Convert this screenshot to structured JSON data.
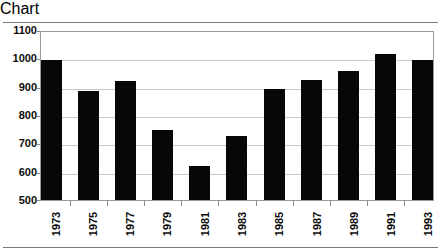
{
  "chart_data": {
    "type": "bar",
    "title": "",
    "subtitle": "",
    "xlabel": "",
    "ylabel": "",
    "categories": [
      "1973",
      "1975",
      "1977",
      "1979",
      "1981",
      "1983",
      "1985",
      "1987",
      "1989",
      "1991",
      "1993"
    ],
    "values": [
      1000,
      890,
      925,
      750,
      620,
      730,
      895,
      930,
      960,
      1020,
      1000
    ],
    "series": [
      {
        "name": "",
        "values": [
          1000,
          890,
          925,
          750,
          620,
          730,
          895,
          930,
          960,
          1020,
          1000
        ]
      }
    ],
    "ylim": [
      500,
      1100
    ],
    "ytick_labels": [
      "1100",
      "1000",
      "900",
      "800",
      "700",
      "600",
      "500"
    ],
    "ytick_values": [
      1100,
      1000,
      900,
      800,
      700,
      600,
      500
    ],
    "grid": "horizontal",
    "legend": "none",
    "bar_color": "#070707",
    "gridline_color": "#c9c9c9",
    "frame_color": "#9a9a9a",
    "background_color": "#ffffff",
    "xlabel_rotation": 90,
    "annotations": []
  }
}
